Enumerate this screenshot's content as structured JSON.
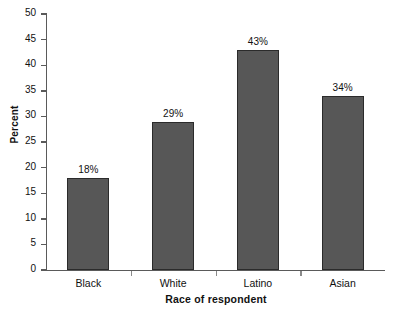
{
  "chart_data": {
    "type": "bar",
    "title": "",
    "xlabel": "Race of respondent",
    "ylabel": "Percent",
    "categories": [
      "Black",
      "White",
      "Latino",
      "Asian"
    ],
    "values": [
      18,
      29,
      43,
      34
    ],
    "value_labels": [
      "18%",
      "29%",
      "43%",
      "34%"
    ],
    "ylim": [
      0,
      50
    ],
    "ytick_labels": [
      "0",
      "5",
      "10",
      "15",
      "20",
      "25",
      "30",
      "35",
      "40",
      "45",
      "50"
    ],
    "ytick_values": [
      0,
      5,
      10,
      15,
      20,
      25,
      30,
      35,
      40,
      45,
      50
    ],
    "grid": false,
    "legend": false,
    "bar_color": "#575757",
    "bar_edge_color": "#2b2b2b",
    "axis_color": "#5a5a5a",
    "background": "#ffffff"
  }
}
